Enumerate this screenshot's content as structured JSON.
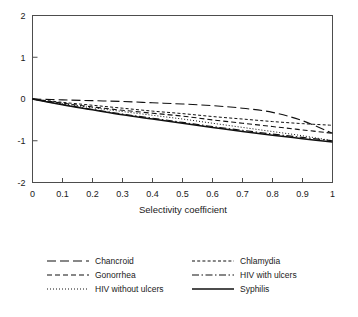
{
  "chart_data": {
    "type": "line",
    "title": "",
    "xlabel": "Selectivity coefficient",
    "ylabel": "",
    "xlim": [
      0,
      1
    ],
    "ylim": [
      -2,
      2
    ],
    "grid": false,
    "legend_position": "bottom",
    "legend_columns": 2,
    "x_ticks": [
      "0",
      "0.1",
      "0.2",
      "0.3",
      "0.4",
      "0.5",
      "0.6",
      "0.7",
      "0.8",
      "0.9",
      "1"
    ],
    "x_tick_values": [
      0,
      0.1,
      0.2,
      0.3,
      0.4,
      0.5,
      0.6,
      0.7,
      0.8,
      0.9,
      1
    ],
    "y_ticks": [
      "2",
      "1",
      "0",
      "-1",
      "-2"
    ],
    "y_tick_values": [
      2,
      1,
      0,
      -1,
      -2
    ],
    "x": [
      0,
      0.1,
      0.2,
      0.3,
      0.4,
      0.5,
      0.6,
      0.7,
      0.8,
      0.9,
      1
    ],
    "series": [
      {
        "name": "Chancroid",
        "style": "long-dash",
        "dasharray": "9,4",
        "width": 1.1,
        "values": [
          0,
          -0.02,
          -0.04,
          -0.06,
          -0.09,
          -0.12,
          -0.16,
          -0.22,
          -0.32,
          -0.52,
          -0.82
        ]
      },
      {
        "name": "Gonorrhea",
        "style": "medium-dash",
        "dasharray": "5,3",
        "width": 1.1,
        "values": [
          0,
          -0.1,
          -0.19,
          -0.27,
          -0.34,
          -0.41,
          -0.5,
          -0.58,
          -0.66,
          -0.74,
          -0.82
        ]
      },
      {
        "name": "HIV without ulcers",
        "style": "fine-dotted",
        "dasharray": "1,2",
        "width": 1.0,
        "values": [
          0,
          -0.11,
          -0.21,
          -0.3,
          -0.39,
          -0.48,
          -0.58,
          -0.68,
          -0.78,
          -0.88,
          -1.0
        ]
      },
      {
        "name": "Chlamydia",
        "style": "short-dash",
        "dasharray": "3,2.2",
        "width": 1.0,
        "values": [
          0,
          -0.08,
          -0.15,
          -0.22,
          -0.29,
          -0.35,
          -0.42,
          -0.48,
          -0.54,
          -0.59,
          -0.63
        ]
      },
      {
        "name": "HIV with ulcers",
        "style": "dash-dot",
        "dasharray": "7,2.5,1.5,2.5",
        "width": 1.1,
        "values": [
          0,
          -0.13,
          -0.25,
          -0.36,
          -0.46,
          -0.56,
          -0.66,
          -0.75,
          -0.84,
          -0.92,
          -1.0
        ]
      },
      {
        "name": "Syphilis",
        "style": "solid",
        "dasharray": "",
        "width": 1.5,
        "values": [
          0,
          -0.14,
          -0.26,
          -0.38,
          -0.48,
          -0.58,
          -0.68,
          -0.78,
          -0.87,
          -0.95,
          -1.03
        ]
      }
    ],
    "legend_entries": [
      {
        "label": "Chancroid",
        "column": 0,
        "row": 0
      },
      {
        "label": "Gonorrhea",
        "column": 0,
        "row": 1
      },
      {
        "label": "HIV without ulcers",
        "column": 0,
        "row": 2
      },
      {
        "label": "Chlamydia",
        "column": 1,
        "row": 0
      },
      {
        "label": "HIV  with ulcers",
        "column": 1,
        "row": 1
      },
      {
        "label": "Syphilis",
        "column": 1,
        "row": 2
      }
    ]
  }
}
